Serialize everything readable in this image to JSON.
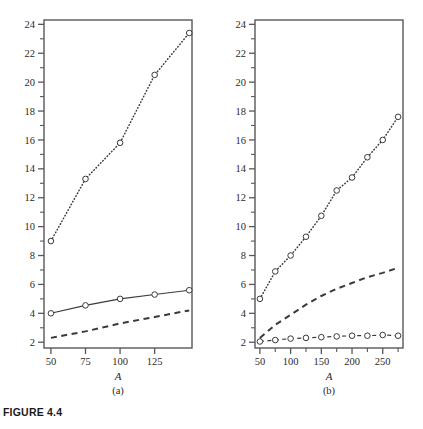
{
  "caption": "FIGURE 4.4",
  "chart_data": [
    {
      "type": "scatter",
      "panel_label": "(a)",
      "title": "",
      "xlabel": "A",
      "ylabel": "",
      "xlim": [
        45,
        152
      ],
      "ylim": [
        1.6,
        24.3
      ],
      "grid": false,
      "legend": "none",
      "xticks_major": [
        50,
        75,
        100,
        125
      ],
      "xticks_minor": [],
      "yticks_major": [
        2,
        4,
        6,
        8,
        10,
        12,
        14,
        16,
        18,
        20,
        22,
        24
      ],
      "yticks_minor": [
        3,
        5,
        7,
        9,
        11,
        13,
        15,
        17,
        19,
        21,
        23
      ],
      "x": [
        50,
        75,
        100,
        125,
        150
      ],
      "series": [
        {
          "name": "upper-dotted",
          "style": "dotted",
          "markers": "open-circle",
          "values": [
            9.0,
            13.3,
            15.8,
            20.5,
            23.4
          ]
        },
        {
          "name": "middle-solid",
          "style": "solid",
          "markers": "open-circle",
          "values": [
            4.0,
            4.55,
            5.0,
            5.3,
            5.6
          ]
        },
        {
          "name": "lower-dashed",
          "style": "dashed",
          "markers": "none",
          "values": [
            2.3,
            2.75,
            3.3,
            3.75,
            4.2
          ]
        }
      ]
    },
    {
      "type": "scatter",
      "panel_label": "(b)",
      "title": "",
      "xlabel": "A",
      "ylabel": "",
      "xlim": [
        42,
        283
      ],
      "ylim": [
        1.6,
        24.3
      ],
      "grid": false,
      "legend": "none",
      "xticks_major": [
        50,
        100,
        150,
        200,
        250
      ],
      "xticks_minor": [
        75,
        125,
        175,
        225,
        275
      ],
      "yticks_major": [
        2,
        4,
        6,
        8,
        10,
        12,
        14,
        16,
        18,
        20,
        22,
        24
      ],
      "yticks_minor": [
        3,
        5,
        7,
        9,
        11,
        13,
        15,
        17,
        19,
        21,
        23
      ],
      "x": [
        50,
        75,
        100,
        125,
        150,
        175,
        200,
        225,
        250,
        275
      ],
      "series": [
        {
          "name": "upper-dotted",
          "style": "dotted",
          "markers": "open-circle",
          "values": [
            5.0,
            6.9,
            8.0,
            9.3,
            10.75,
            12.5,
            13.4,
            14.8,
            16.0,
            17.6
          ]
        },
        {
          "name": "middle-dashed",
          "style": "dashed",
          "markers": "none",
          "values": [
            2.3,
            3.2,
            3.9,
            4.6,
            5.2,
            5.7,
            6.1,
            6.5,
            6.8,
            7.15
          ]
        },
        {
          "name": "lower-dashed-circles",
          "style": "dashedthin",
          "markers": "open-circle",
          "values": [
            2.05,
            2.15,
            2.25,
            2.3,
            2.35,
            2.4,
            2.45,
            2.45,
            2.5,
            2.45
          ]
        }
      ]
    }
  ]
}
